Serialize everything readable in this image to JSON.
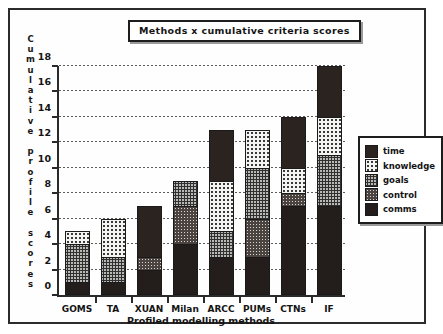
{
  "figure": {
    "title": "Methods  x  cumulative criteria scores",
    "y_axis_caption": "Cumulative profile scores",
    "x_axis_caption": "Profiled modelling methods"
  },
  "chart_data": {
    "type": "bar",
    "stacked": true,
    "title": "Methods  x  cumulative criteria scores",
    "xlabel": "Profiled modelling methods",
    "ylabel": "Cumulative profile scores",
    "ylim": [
      0,
      18
    ],
    "ytick_values": [
      0,
      2,
      4,
      6,
      8,
      10,
      12,
      14,
      16,
      18
    ],
    "ytick_labels": [
      "0",
      "2",
      "4",
      "6",
      "8",
      "10",
      "12",
      "14",
      "16",
      "18"
    ],
    "grid": true,
    "legend_position": "right",
    "categories": [
      "GOMS",
      "TA",
      "XUAN",
      "Milan",
      "ARCC",
      "PUMs",
      "CTNs",
      "IF"
    ],
    "stack_order_bottom_to_top": [
      "comms",
      "control",
      "goals",
      "knowledge",
      "time"
    ],
    "series": [
      {
        "name": "comms",
        "fill": "solid-black",
        "color": "#231d1b",
        "values": [
          1,
          1,
          2,
          4,
          3,
          3,
          7,
          7
        ]
      },
      {
        "name": "control",
        "fill": "dark-dotted",
        "color": "#4a4340",
        "values": [
          0,
          0,
          1,
          3,
          0,
          3,
          1,
          0
        ]
      },
      {
        "name": "goals",
        "fill": "gray-checker",
        "color": "#b9b9b6",
        "values": [
          3,
          2,
          0,
          2,
          2,
          4,
          0,
          4
        ]
      },
      {
        "name": "knowledge",
        "fill": "white-dotted",
        "color": "#f4f4f2",
        "values": [
          1,
          3,
          0,
          0,
          4,
          3,
          2,
          3
        ]
      },
      {
        "name": "time",
        "fill": "solid-dark",
        "color": "#2a2320",
        "values": [
          0,
          0,
          4,
          0,
          4,
          0,
          4,
          4
        ]
      }
    ],
    "totals": [
      5,
      6,
      7,
      9,
      13,
      13,
      14,
      18
    ]
  },
  "legend": {
    "items": [
      {
        "label": "time"
      },
      {
        "label": "knowledge"
      },
      {
        "label": "goals"
      },
      {
        "label": "control"
      },
      {
        "label": "comms"
      }
    ]
  }
}
